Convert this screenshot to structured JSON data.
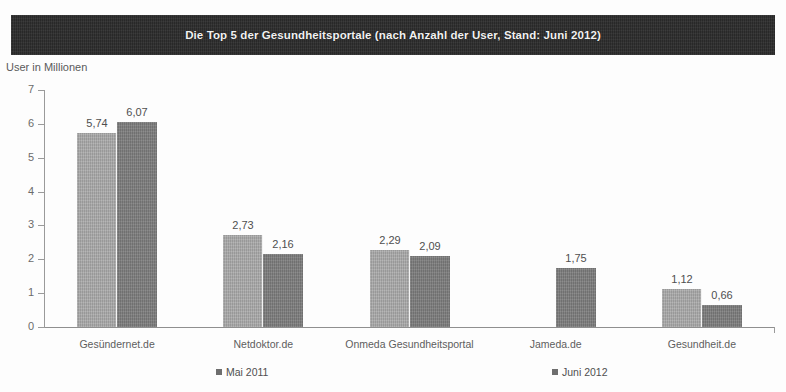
{
  "header": {
    "title": "Die Top 5 der Gesundheitsportale (nach Anzahl der User, Stand: Juni 2012)"
  },
  "axis": {
    "ylabel": "User in Millionen",
    "yticks": [
      "7",
      "6",
      "5",
      "4",
      "3",
      "2",
      "1",
      "0"
    ]
  },
  "legend": {
    "series1": "Mai 2011",
    "series2": "Juni 2012"
  },
  "colors": {
    "banner": "#2c2c2c",
    "series1": "#a9a9a9",
    "series2": "#7d7d7d",
    "axis": "#9a9a9a",
    "text": "#4f4f4f"
  },
  "chart_data": {
    "type": "bar",
    "title": "Die Top 5 der Gesundheitsportale (nach Anzahl der User, Stand: Juni 2012)",
    "xlabel": "",
    "ylabel": "User in Millionen",
    "ylim": [
      0,
      7
    ],
    "yticks": [
      0,
      1,
      2,
      3,
      4,
      5,
      6,
      7
    ],
    "grid": false,
    "legend_position": "bottom",
    "categories": [
      "Gesündernet.de",
      "Netdoktor.de",
      "Onmeda Gesundheitsportal",
      "Jameda.de",
      "Gesundheit.de"
    ],
    "series": [
      {
        "name": "Mai 2011",
        "color": "#a9a9a9",
        "values": [
          5.74,
          2.73,
          2.29,
          null,
          1.12
        ],
        "labels": [
          "5,74",
          "2,73",
          "2,29",
          "",
          "1,12"
        ]
      },
      {
        "name": "Juni 2012",
        "color": "#7d7d7d",
        "values": [
          6.07,
          2.16,
          2.09,
          1.75,
          0.66
        ],
        "labels": [
          "6,07",
          "2,16",
          "2,09",
          "1,75",
          "0,66"
        ]
      }
    ]
  }
}
